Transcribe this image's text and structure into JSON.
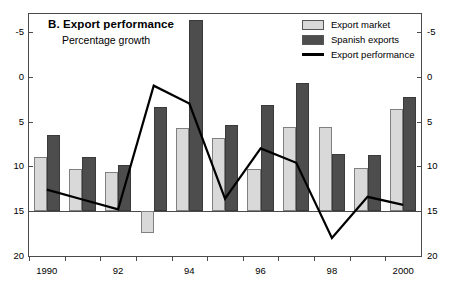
{
  "panel": {
    "title": "B. Export performance",
    "subtitle": "Percentage growth"
  },
  "legend": {
    "position": "top-right",
    "items": [
      {
        "label": "Export market",
        "marker": "light-square-swatch",
        "color": "#d9d9d9"
      },
      {
        "label": "Spanish exports",
        "marker": "dark-square-swatch",
        "color": "#4d4d4d"
      },
      {
        "label": "Export performance",
        "marker": "black-line-swatch",
        "color": "#000000"
      }
    ]
  },
  "axes": {
    "y_left_ticks": [
      "20",
      "15",
      "10",
      "5",
      "0",
      "-5"
    ],
    "y_right_ticks": [
      "20",
      "15",
      "10",
      "5",
      "0",
      "-5"
    ],
    "x_ticks": [
      "1990",
      "92",
      "94",
      "96",
      "98",
      "2000"
    ]
  },
  "chart_data": {
    "type": "bar",
    "title": "B. Export performance",
    "subtitle": "Percentage growth",
    "xlabel": "",
    "ylabel": "Percentage growth",
    "ylim": [
      -5,
      22
    ],
    "yticks": [
      -5,
      0,
      5,
      10,
      15,
      20
    ],
    "grid": false,
    "legend_position": "top-right",
    "categories": [
      "1990",
      "1991",
      "1992",
      "1993",
      "1994",
      "1995",
      "1996",
      "1997",
      "1998",
      "1999",
      "2000"
    ],
    "xtick_labels": [
      "1990",
      "",
      "92",
      "",
      "94",
      "",
      "96",
      "",
      "98",
      "",
      "2000"
    ],
    "series": [
      {
        "name": "Export market",
        "type": "bar",
        "color": "#d9d9d9",
        "values": [
          6.0,
          4.7,
          4.4,
          -2.4,
          9.3,
          8.2,
          4.7,
          9.4,
          9.4,
          4.8,
          11.4
        ]
      },
      {
        "name": "Spanish exports",
        "type": "bar",
        "color": "#4d4d4d",
        "values": [
          8.5,
          6.0,
          5.2,
          11.6,
          21.3,
          9.6,
          11.9,
          14.3,
          6.4,
          6.3,
          12.7
        ]
      },
      {
        "name": "Export performance",
        "type": "line",
        "color": "#000000",
        "values": [
          2.4,
          1.3,
          0.2,
          14.0,
          12.0,
          1.4,
          7.0,
          5.4,
          -3.0,
          1.6,
          0.7
        ]
      }
    ]
  }
}
